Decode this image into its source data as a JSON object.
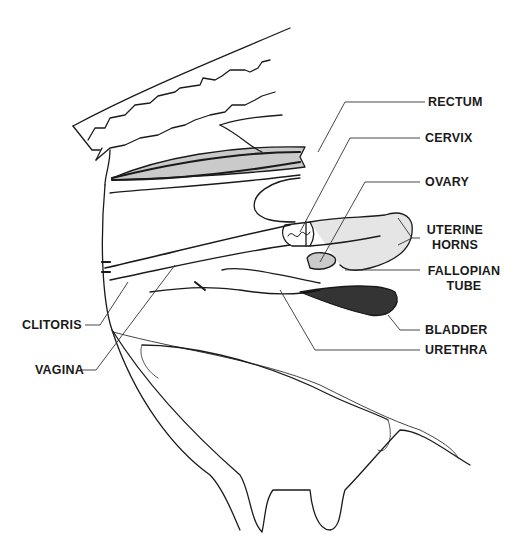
{
  "diagram": {
    "labels": {
      "rectum": "RECTUM",
      "cervix": "CERVIX",
      "ovary": "OVARY",
      "uterine_horns_1": "UTERINE",
      "uterine_horns_2": "HORNS",
      "fallopian_tube_1": "FALLOPIAN",
      "fallopian_tube_2": "TUBE",
      "bladder": "BLADDER",
      "urethra": "URETHRA",
      "clitoris": "CLITORIS",
      "vagina": "VAGINA"
    },
    "colors": {
      "ink": "#1a1a1a",
      "background": "#ffffff",
      "leader": "#333333"
    }
  }
}
